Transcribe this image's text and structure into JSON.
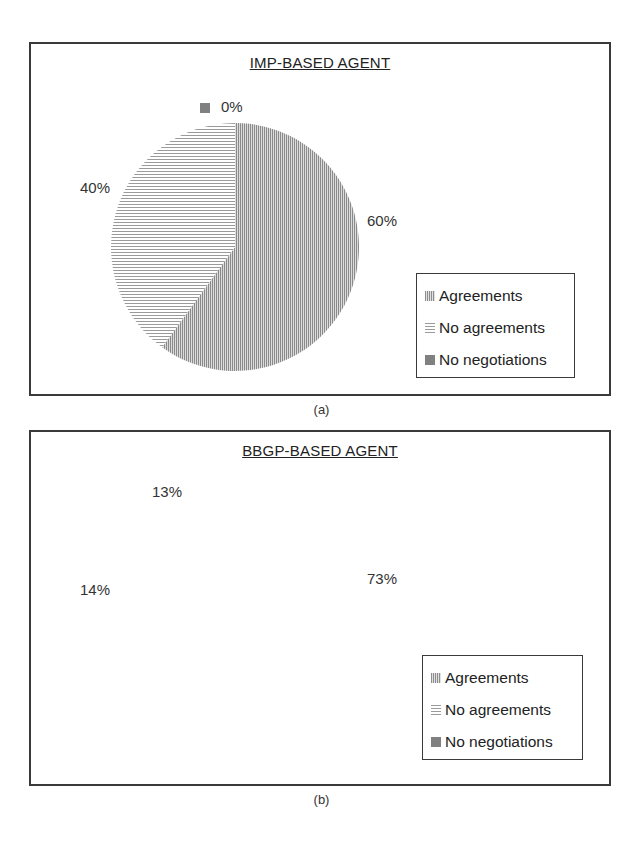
{
  "figure_a": {
    "title": "IMP-BASED AGENT",
    "caption": "(a)",
    "labels": {
      "agreements": "60%",
      "no_agreements": "40%",
      "no_negotiations": "0%"
    },
    "legend": [
      "Agreements",
      "No agreements",
      "No negotiations"
    ]
  },
  "figure_b": {
    "title": "BBGP-BASED AGENT",
    "caption": "(b)",
    "labels": {
      "agreements": "73%",
      "no_agreements": "14%",
      "no_negotiations": "13%"
    },
    "legend": [
      "Agreements",
      "No agreements",
      "No negotiations"
    ]
  },
  "colors": {
    "agreements": "#a8a8a8",
    "no_agreements": "#d8d8d8",
    "no_negotiations": "#808080",
    "frame": "#3a3a3a"
  },
  "chart_data": [
    {
      "type": "pie",
      "title": "IMP-BASED AGENT",
      "categories": [
        "Agreements",
        "No agreements",
        "No negotiations"
      ],
      "values": [
        60,
        40,
        0
      ],
      "unit": "%",
      "legend_position": "right-bottom",
      "caption": "(a)"
    },
    {
      "type": "pie",
      "title": "BBGP-BASED AGENT",
      "categories": [
        "Agreements",
        "No agreements",
        "No negotiations"
      ],
      "values": [
        73,
        14,
        13
      ],
      "unit": "%",
      "legend_position": "right-bottom",
      "caption": "(b)"
    }
  ]
}
